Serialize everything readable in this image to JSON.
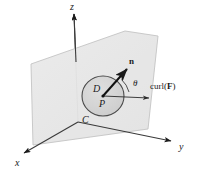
{
  "figure": {
    "background_color": "#ffffff",
    "ink_color": "#1a1a1a",
    "plane_fill": "#e8e8e8",
    "plane_stroke": "#b8b8b8",
    "disk_fill": "#d4d4d4",
    "disk_stroke": "#5a5a5a"
  },
  "axes": [
    {
      "name": "z-axis",
      "label": "z",
      "label_x": 70,
      "label_y": 3
    },
    {
      "name": "y-axis",
      "label": "y",
      "label_x": 179,
      "label_y": 146
    },
    {
      "name": "x-axis",
      "label": "x",
      "label_x": 16,
      "label_y": 162
    }
  ],
  "labels": {
    "disk": "D",
    "disk_x": 95,
    "disk_y": 88,
    "curve": "C",
    "curve_x": 84,
    "curve_y": 118,
    "point": "P",
    "point_x": 100,
    "point_y": 104,
    "normal": "n",
    "normal_x": 129,
    "normal_y": 62,
    "angle": "θ",
    "angle_x": 133,
    "angle_y": 84,
    "curl_prefix": "curl(",
    "curl_field": "F",
    "curl_suffix": ")",
    "curl_x": 152,
    "curl_y": 86
  },
  "geometry": {
    "origin": {
      "x": 78,
      "y": 122
    },
    "plane_corners": [
      {
        "x": 125,
        "y": 31
      },
      {
        "x": 158,
        "y": 36
      },
      {
        "x": 148,
        "y": 129
      },
      {
        "x": 33,
        "y": 145
      },
      {
        "x": 31,
        "y": 64
      }
    ],
    "disk_center": {
      "x": 103,
      "y": 96
    },
    "disk_radius_x": 21,
    "disk_radius_y": 20,
    "normal_tip": {
      "x": 128,
      "y": 68
    },
    "curl_tip": {
      "x": 151,
      "y": 98
    },
    "z_axis_top": {
      "x": 74,
      "y": 12
    },
    "y_axis_tip": {
      "x": 173,
      "y": 141
    },
    "x_axis_tip": {
      "x": 22,
      "y": 154
    }
  }
}
